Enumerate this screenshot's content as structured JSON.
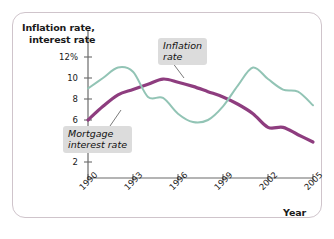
{
  "figure": {
    "y_axis_title_line1": "Inflation rate,",
    "y_axis_title_line2": "interest rate",
    "x_axis_title": "Year",
    "callout_inflation_line1": "Inflation",
    "callout_inflation_line2": "rate",
    "callout_mortgage_line1": "Mortgage",
    "callout_mortgage_line2": "interest rate"
  },
  "colors": {
    "inflation": "#8e3d7f",
    "mortgage": "#92c4b5",
    "frame_border": "#cfc4cb",
    "axis": "#6b6b6b",
    "callout_background": "#dcdcdc",
    "text": "#1a1a1a"
  },
  "chart_data": {
    "type": "line",
    "title": "",
    "subtitle": "",
    "xlabel": "Year",
    "ylabel": "Inflation rate, interest rate",
    "xlim": [
      1990,
      2005
    ],
    "ylim": [
      0,
      13
    ],
    "grid": false,
    "legend_position": "inline-callouts",
    "y_ticks": [
      2,
      4,
      6,
      8,
      10,
      12
    ],
    "y_tick_labels": [
      "2",
      "4",
      "6",
      "8",
      "10",
      "12%"
    ],
    "x_ticks": [
      1990,
      1993,
      1996,
      1999,
      2002,
      2005
    ],
    "x_tick_labels": [
      "1990",
      "1993",
      "1996",
      "1999",
      "2002",
      "2005"
    ],
    "x": [
      1990,
      1991,
      1992,
      1993,
      1994,
      1995,
      1996,
      1997,
      1998,
      1999,
      2000,
      2001,
      2002,
      2003,
      2004,
      2005
    ],
    "series": [
      {
        "name": "Inflation rate",
        "color": "#8e3d7f",
        "values": [
          6.0,
          7.3,
          8.4,
          8.9,
          9.4,
          9.9,
          9.6,
          9.2,
          8.7,
          8.2,
          7.5,
          6.6,
          5.3,
          5.3,
          4.6,
          3.9
        ]
      },
      {
        "name": "Mortgage interest rate",
        "color": "#92c4b5",
        "values": [
          9.0,
          10.0,
          11.0,
          10.6,
          8.2,
          8.1,
          6.6,
          5.8,
          6.0,
          7.3,
          9.3,
          11.0,
          9.9,
          8.9,
          8.7,
          7.4
        ]
      }
    ],
    "annotations": [
      {
        "label": "Inflation rate",
        "target_series": "Inflation rate",
        "target_x": 1997.3,
        "target_y": 9.25
      },
      {
        "label": "Mortgage interest rate",
        "target_series": "Mortgage interest rate",
        "target_x": 1994.7,
        "target_y": 7.0
      }
    ]
  }
}
